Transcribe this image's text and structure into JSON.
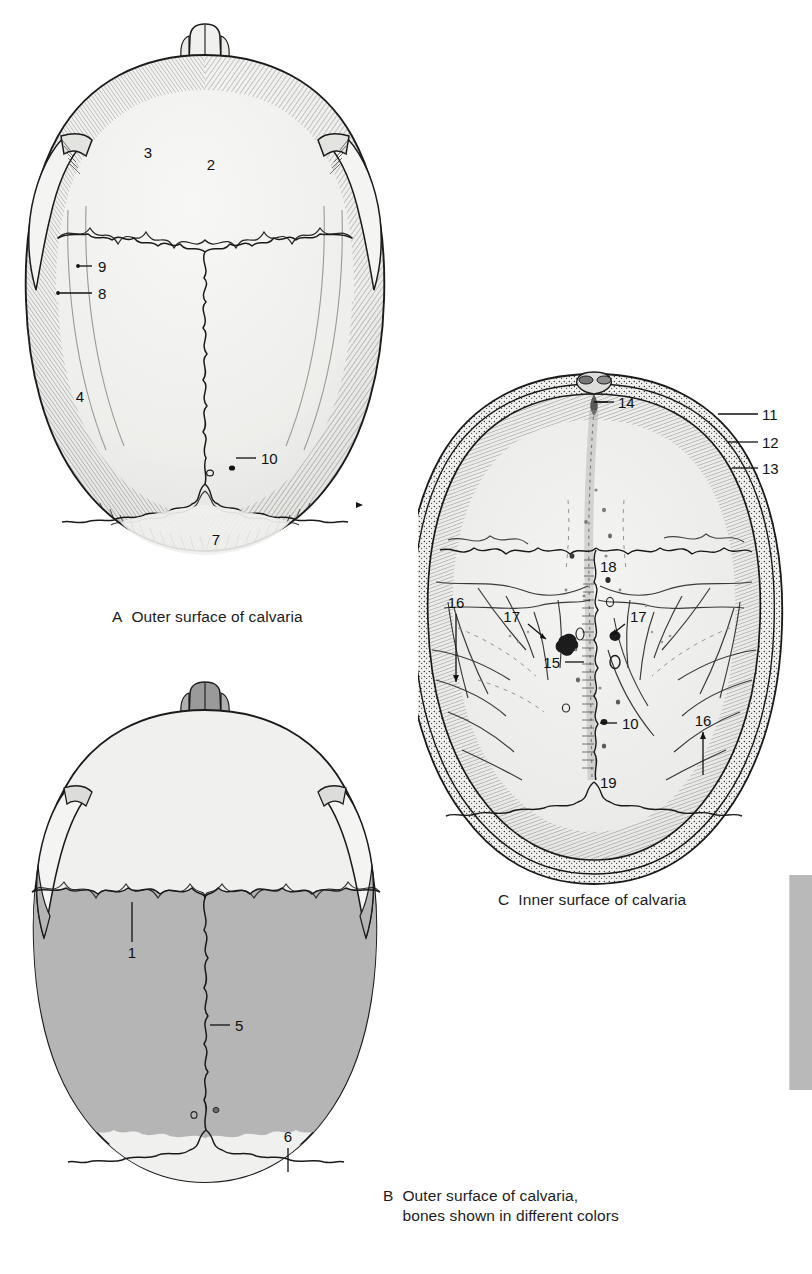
{
  "page": {
    "width": 812,
    "height": 1274,
    "background": "#ffffff"
  },
  "colors": {
    "bone_light": "#f2f2f0",
    "bone_mid": "#e6e6e4",
    "bone_dark_gray": "#b5b5b5",
    "nasal_gray": "#9a9a9a",
    "outline": "#1a1a1a",
    "hatch": "#2b2b2b",
    "label_text": "#111111",
    "caption_text": "#1c1c1c",
    "edge_tab": "#b9b9b9"
  },
  "figures": [
    {
      "id": "A",
      "name": "outer-surface-of-calvaria",
      "caption_letter": "A",
      "caption_text": "Outer surface of calvaria",
      "caption_x": 112,
      "caption_y": 607,
      "view": "superior view of the calvaria, outer surface",
      "labels": [
        {
          "id": "2",
          "x": 211,
          "y": 155,
          "leader": false
        },
        {
          "id": "3",
          "x": 148,
          "y": 142,
          "leader": false
        },
        {
          "id": "4",
          "x": 80,
          "y": 396,
          "leader": false
        },
        {
          "id": "7",
          "x": 216,
          "y": 539,
          "leader": false
        },
        {
          "id": "8",
          "x": 101,
          "y": 297,
          "leader": true,
          "lx1": 58,
          "ly1": 293,
          "lx2": 92,
          "ly2": 293
        },
        {
          "id": "9",
          "x": 101,
          "y": 270,
          "leader": true,
          "lx1": 78,
          "ly1": 266,
          "lx2": 92,
          "ly2": 266
        },
        {
          "id": "10",
          "x": 265,
          "y": 461,
          "leader": true,
          "lx1": 233,
          "ly1": 458,
          "lx2": 256,
          "ly2": 458
        }
      ]
    },
    {
      "id": "B",
      "name": "outer-surface-of-calvaria-colored-bones",
      "caption_letter": "B",
      "caption_line1": "Outer surface of calvaria,",
      "caption_line2": "bones shown in different colors",
      "caption_x": 383,
      "caption_y": 1186,
      "view": "superior view of the calvaria, bones shown in different colors",
      "labels": [
        {
          "id": "1",
          "x": 148,
          "y": 953,
          "leader": true,
          "lx1": 150,
          "ly1": 912,
          "lx2": 150,
          "ly2": 941
        },
        {
          "id": "5",
          "x": 245,
          "y": 1028,
          "leader": true,
          "lx1": 214,
          "ly1": 1024,
          "lx2": 236,
          "ly2": 1024
        },
        {
          "id": "6",
          "x": 293,
          "y": 1140,
          "leader": true,
          "lx1": 296,
          "ly1": 1148,
          "lx2": 296,
          "ly2": 1172
        }
      ]
    },
    {
      "id": "C",
      "name": "inner-surface-of-calvaria",
      "caption_letter": "C",
      "caption_text": "Inner surface of calvaria",
      "caption_x": 498,
      "caption_y": 890,
      "view": "inferior view of the calvaria, inner surface",
      "labels": [
        {
          "id": "11",
          "x": 759,
          "y": 418,
          "leader": true,
          "lx1": 718,
          "ly1": 414,
          "lx2": 750,
          "ly2": 414
        },
        {
          "id": "12",
          "x": 759,
          "y": 447,
          "leader": true,
          "lx1": 727,
          "ly1": 443,
          "lx2": 750,
          "ly2": 443
        },
        {
          "id": "13",
          "x": 759,
          "y": 472,
          "leader": true,
          "lx1": 731,
          "ly1": 468,
          "lx2": 750,
          "ly2": 468
        },
        {
          "id": "14",
          "x": 616,
          "y": 406,
          "leader": true,
          "lx1": 585,
          "ly1": 402,
          "lx2": 607,
          "ly2": 402
        },
        {
          "id": "15",
          "x": 540,
          "y": 666,
          "leader": true,
          "lx1": 565,
          "ly1": 662,
          "lx2": 584,
          "ly2": 662
        },
        {
          "id": "16",
          "x": 452,
          "y": 604,
          "leader": true,
          "lx1": 456,
          "ly1": 614,
          "lx2": 456,
          "ly2": 682
        },
        {
          "id": "16",
          "x": 699,
          "y": 722,
          "leader": true,
          "lx1": 703,
          "ly1": 732,
          "lx2": 703,
          "ly2": 775
        },
        {
          "id": "17",
          "x": 516,
          "y": 617,
          "leader": true,
          "lx1": 528,
          "ly1": 624,
          "lx2": 545,
          "ly2": 639
        },
        {
          "id": "17",
          "x": 629,
          "y": 617,
          "leader": true,
          "lx1": 625,
          "ly1": 624,
          "lx2": 611,
          "ly2": 636
        },
        {
          "id": "18",
          "x": 595,
          "y": 567,
          "leader": false
        },
        {
          "id": "19",
          "x": 596,
          "y": 783,
          "leader": false
        },
        {
          "id": "10",
          "x": 625,
          "y": 727,
          "leader": true,
          "lx1": 600,
          "ly1": 723,
          "lx2": 617,
          "ly2": 723
        }
      ]
    }
  ],
  "edge_tab": {
    "name": "page-edge-tab",
    "x": 790,
    "y": 875,
    "width": 22,
    "height": 215,
    "color": "#b9b9b9"
  }
}
